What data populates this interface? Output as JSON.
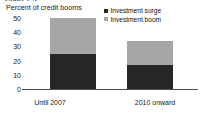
{
  "top_caption_sliver": "Chart 2.5",
  "chart_data": {
    "type": "bar",
    "subtype": "stacked",
    "title": "",
    "ylabel": "Percent of credit booms",
    "xlabel": "",
    "categories": [
      "Until 2007",
      "2010 onward"
    ],
    "series": [
      {
        "name": "Investment surge",
        "values": [
          25,
          17
        ],
        "color": "#262626"
      },
      {
        "name": "Investment boom",
        "values": [
          25,
          17
        ],
        "color": "#a6a6a6"
      }
    ],
    "totals": [
      50,
      34
    ],
    "ylim": [
      0,
      50
    ],
    "yticks": [
      0,
      10,
      20,
      30,
      40,
      50
    ],
    "ytick_labels": [
      "0",
      "10",
      "20",
      "30",
      "40",
      "50"
    ],
    "grid": false,
    "legend_position": "top-right"
  },
  "legend": {
    "items": [
      {
        "label": "Investment surge",
        "color": "#262626"
      },
      {
        "label": "Investment boom",
        "color": "#a6a6a6"
      }
    ]
  },
  "axis": {
    "y_title": "Percent of credit booms",
    "y_tick_0": "0",
    "y_tick_1": "10",
    "y_tick_2": "20",
    "y_tick_3": "30",
    "y_tick_4": "40",
    "y_tick_5": "50",
    "x_cat_0": "Until 2007",
    "x_cat_1": "2010 onward"
  },
  "colors": {
    "surge": "#262626",
    "boom": "#a6a6a6",
    "axis": "#4d4d4d",
    "text": "#1a1a1a",
    "background": "#ffffff"
  }
}
